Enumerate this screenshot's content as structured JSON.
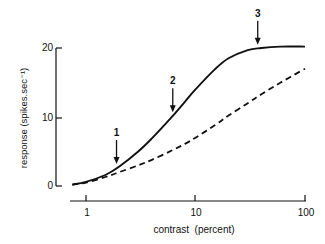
{
  "chart_data": {
    "type": "line",
    "title": "",
    "xlabel": "contrast  (percent)",
    "ylabel": "response  (spikes.sec⁻¹)",
    "xscale": "log",
    "xlim": [
      0.75,
      100
    ],
    "ylim": [
      0,
      20
    ],
    "xticks": [
      1,
      10,
      100
    ],
    "xtick_labels": [
      "1",
      "10",
      "100"
    ],
    "yticks": [
      0,
      10,
      20
    ],
    "ytick_labels": [
      "0",
      "10",
      "20"
    ],
    "grid": false,
    "legend": null,
    "series": [
      {
        "name": "solid",
        "style": "solid",
        "x": [
          0.75,
          1,
          1.5,
          2,
          3,
          4,
          6,
          8,
          10,
          15,
          20,
          30,
          40,
          60,
          100
        ],
        "y": [
          0.2,
          0.6,
          1.6,
          2.8,
          5.0,
          6.9,
          9.9,
          12.2,
          14.0,
          16.9,
          18.5,
          19.7,
          20.0,
          20.2,
          20.2
        ]
      },
      {
        "name": "dashed",
        "style": "dashed",
        "x": [
          0.75,
          1,
          1.5,
          2,
          3,
          4,
          6,
          8,
          10,
          15,
          20,
          30,
          40,
          60,
          100
        ],
        "y": [
          0.2,
          0.5,
          1.3,
          2.0,
          3.0,
          3.8,
          5.1,
          6.1,
          7.0,
          8.8,
          10.2,
          12.0,
          13.3,
          15.0,
          17.0
        ]
      }
    ],
    "annotations": [
      {
        "label": "1",
        "x": 1.9,
        "type": "arrow-down",
        "points_to_y": 2.6
      },
      {
        "label": "2",
        "x": 6.2,
        "type": "arrow-down",
        "points_to_y": 10.1
      },
      {
        "label": "3",
        "x": 37,
        "type": "arrow-down",
        "points_to_y": 19.9
      }
    ]
  }
}
